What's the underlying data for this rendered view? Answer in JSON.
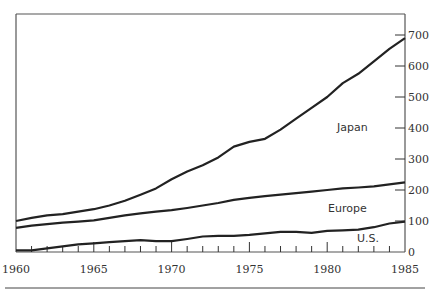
{
  "chart_data": {
    "type": "line",
    "title": "",
    "xlabel": "",
    "ylabel": "",
    "x": [
      1960,
      1961,
      1962,
      1963,
      1964,
      1965,
      1966,
      1967,
      1968,
      1969,
      1970,
      1971,
      1972,
      1973,
      1974,
      1975,
      1976,
      1977,
      1978,
      1979,
      1980,
      1981,
      1982,
      1983,
      1984,
      1985
    ],
    "series": [
      {
        "name": "Japan",
        "values": [
          100,
          110,
          118,
          122,
          130,
          138,
          150,
          165,
          185,
          205,
          235,
          260,
          280,
          305,
          340,
          355,
          365,
          395,
          430,
          465,
          500,
          545,
          575,
          615,
          655,
          690
        ]
      },
      {
        "name": "Europe",
        "values": [
          78,
          85,
          90,
          95,
          98,
          102,
          110,
          118,
          125,
          130,
          135,
          142,
          150,
          158,
          168,
          175,
          180,
          185,
          190,
          195,
          200,
          205,
          208,
          212,
          218,
          225
        ]
      },
      {
        "name": "U.S.",
        "values": [
          5,
          5,
          12,
          18,
          25,
          28,
          32,
          35,
          38,
          35,
          35,
          42,
          50,
          52,
          52,
          55,
          60,
          65,
          65,
          62,
          68,
          70,
          72,
          80,
          92,
          98
        ]
      }
    ],
    "xlim": [
      1960,
      1985
    ],
    "ylim": [
      0,
      700
    ],
    "x_ticks": [
      "1960",
      "1965",
      "1970",
      "1975",
      "1980",
      "1985"
    ],
    "y_ticks": [
      "0",
      "100",
      "200",
      "300",
      "400",
      "500",
      "600",
      "700"
    ],
    "y_axis_position": "right",
    "grid": false,
    "legend": "inline labels"
  }
}
